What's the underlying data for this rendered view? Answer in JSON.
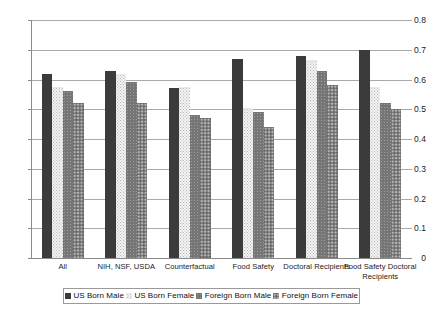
{
  "chart_data": {
    "type": "bar",
    "title": "",
    "subtitle": "",
    "xlabel": "",
    "ylabel": "",
    "ylim": [
      0,
      0.8
    ],
    "ytick_labels": [
      "0.8",
      "0.7",
      "0.6",
      "0.5",
      "0.4",
      "0.3",
      "0.2",
      "0.1",
      "0"
    ],
    "ytick_values": [
      0.8,
      0.7,
      0.6,
      0.5,
      0.4,
      0.3,
      0.2,
      0.1,
      0
    ],
    "grid": true,
    "legend_position": "bottom",
    "categories": [
      "All",
      "NIH, NSF, USDA",
      "Counterfactual",
      "Food Safety",
      "Doctoral Recipients",
      "Food Safety Doctoral Recipients"
    ],
    "series": [
      {
        "name": "US Born Male",
        "color": "#3b3b3b",
        "values": [
          0.62,
          0.63,
          0.57,
          0.67,
          0.68,
          0.7
        ]
      },
      {
        "name": "US Born Female",
        "color": "#f3f3f3",
        "values": [
          0.575,
          0.62,
          0.575,
          0.505,
          0.665,
          0.575
        ]
      },
      {
        "name": "Foreign Born Male",
        "color": "#767676",
        "values": [
          0.56,
          0.59,
          0.48,
          0.49,
          0.63,
          0.52
        ]
      },
      {
        "name": "Foreign Born Female",
        "color": "#7e7e7e",
        "values": [
          0.52,
          0.52,
          0.47,
          0.44,
          0.58,
          0.5
        ]
      }
    ]
  },
  "legend": {
    "items": [
      {
        "label": "US Born Male"
      },
      {
        "label": "US Born Female"
      },
      {
        "label": "Foreign Born Male"
      },
      {
        "label": "Foreign Born Female"
      }
    ]
  }
}
